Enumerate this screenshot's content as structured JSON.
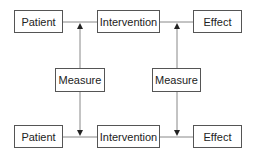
{
  "diagram": {
    "top_row": [
      {
        "label": "Patient"
      },
      {
        "label": "Intervention"
      },
      {
        "label": "Effect"
      }
    ],
    "middle_row": [
      {
        "label": "Measure"
      },
      {
        "label": "Measure"
      }
    ],
    "bottom_row": [
      {
        "label": "Patient"
      },
      {
        "label": "Intervention"
      },
      {
        "label": "Effect"
      }
    ]
  }
}
